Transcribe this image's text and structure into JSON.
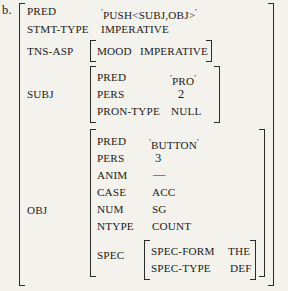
{
  "item": {
    "label": "b."
  },
  "structure": {
    "type": "f-structure",
    "rows": [
      {
        "attribute": "PRED",
        "value": "'PUSH<SUBJ,OBJ>'",
        "kind": "quoted"
      },
      {
        "attribute": "STMT-TYPE",
        "value": "IMPERATIVE",
        "kind": "plain"
      },
      {
        "attribute": "TNS-ASP",
        "kind": "matrix",
        "rows": [
          {
            "attribute": "MOOD",
            "value": "IMPERATIVE",
            "kind": "plain"
          }
        ]
      },
      {
        "attribute": "SUBJ",
        "kind": "matrix",
        "rows": [
          {
            "attribute": "PRED",
            "value": "'PRO'",
            "kind": "quoted"
          },
          {
            "attribute": "PERS",
            "value": "2",
            "kind": "number"
          },
          {
            "attribute": "PRON-TYPE",
            "value": "NULL",
            "kind": "plain"
          }
        ]
      },
      {
        "attribute": "OBJ",
        "kind": "matrix",
        "rows": [
          {
            "attribute": "PRED",
            "value": "'BUTTON'",
            "kind": "quoted"
          },
          {
            "attribute": "PERS",
            "value": "3",
            "kind": "number"
          },
          {
            "attribute": "ANIM",
            "value": "—",
            "kind": "dash"
          },
          {
            "attribute": "CASE",
            "value": "ACC",
            "kind": "plain"
          },
          {
            "attribute": "NUM",
            "value": "SG",
            "kind": "plain"
          },
          {
            "attribute": "NTYPE",
            "value": "COUNT",
            "kind": "plain"
          },
          {
            "attribute": "SPEC",
            "kind": "matrix",
            "rows": [
              {
                "attribute": "SPEC-FORM",
                "value": "THE",
                "kind": "plain"
              },
              {
                "attribute": "SPEC-TYPE",
                "value": "DEF",
                "kind": "plain"
              }
            ]
          }
        ]
      }
    ]
  },
  "text": {
    "pred_attr": "PRED",
    "pred_val_open_quote": "′",
    "pred_val_body": "PUSH<SUBJ,OBJ>",
    "pred_val_close_quote": "′",
    "stmt_type_attr": "STMT-TYPE",
    "stmt_type_val": "IMPERATIVE",
    "tns_asp_attr": "TNS-ASP",
    "mood_attr": "MOOD",
    "mood_val": "IMPERATIVE",
    "subj_attr": "SUBJ",
    "subj_pred_attr": "PRED",
    "subj_pred_open_quote": "′",
    "subj_pred_body": "PRO",
    "subj_pred_close_quote": "′",
    "subj_pers_attr": "PERS",
    "subj_pers_val": "2",
    "subj_prontype_attr": "PRON-TYPE",
    "subj_prontype_val": "NULL",
    "obj_attr": "OBJ",
    "obj_pred_attr": "PRED",
    "obj_pred_open_quote": "′",
    "obj_pred_body": "BUTTON",
    "obj_pred_close_quote": "′",
    "obj_pers_attr": "PERS",
    "obj_pers_val": "3",
    "obj_anim_attr": "ANIM",
    "obj_anim_val": "—",
    "obj_case_attr": "CASE",
    "obj_case_val": "ACC",
    "obj_num_attr": "NUM",
    "obj_num_val": "SG",
    "obj_ntype_attr": "NTYPE",
    "obj_ntype_val": "COUNT",
    "obj_spec_attr": "SPEC",
    "spec_form_attr": "SPEC-FORM",
    "spec_form_val": "THE",
    "spec_type_attr": "SPEC-TYPE",
    "spec_type_val": "DEF"
  },
  "colors": {
    "background": "#f4f2ec",
    "ink": "#1a1a1a",
    "rule": "#2b2b2b"
  }
}
